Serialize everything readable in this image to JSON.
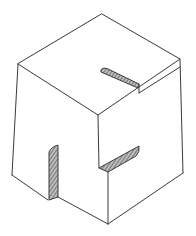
{
  "figure": {
    "title": "Isometric cube with slots",
    "line_color": "#3a3a3a",
    "hatch_color": "#555555",
    "background": "#ffffff"
  }
}
